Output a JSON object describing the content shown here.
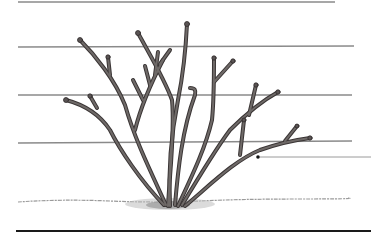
{
  "figure": {
    "subject": "pruned shrub trained on horizontal wires",
    "colors": {
      "background": "#ffffff",
      "wire": "#8a8a8a",
      "stem": "#6f6a68",
      "stem_outline": "#3a3535",
      "ground": "#9a9a9a",
      "rule": "#1a1a1a"
    },
    "wires": [
      {
        "y": 2,
        "x1": 18,
        "x2": 335
      },
      {
        "y": 47,
        "x1": 18,
        "x2": 354
      },
      {
        "y": 95,
        "x1": 18,
        "x2": 352
      },
      {
        "y": 143,
        "x1": 18,
        "x2": 352
      }
    ],
    "pointer": {
      "dot_x": 258,
      "dot_y": 157,
      "line_to_x": 371
    },
    "ground_y": 203,
    "bottom_rule_y": 231
  }
}
